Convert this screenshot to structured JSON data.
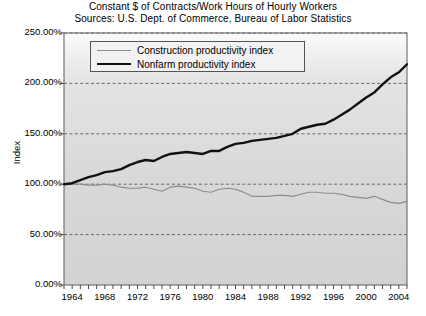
{
  "chart_data": {
    "type": "line",
    "title": "Constant $ of Contracts/Work Hours of Hourly Workers",
    "subtitle": "Sources: U.S. Dept. of Commerce, Bureau of Labor Statistics",
    "xlabel": "",
    "ylabel": "Index",
    "ylim": [
      0,
      250
    ],
    "xlim": [
      1963,
      2005
    ],
    "grid": true,
    "legend_position": "top-center-inside",
    "ytick_labels": [
      "0.00%",
      "50.00%",
      "100.00%",
      "150.00%",
      "200.00%",
      "250.00%"
    ],
    "ytick_values": [
      0,
      50,
      100,
      150,
      200,
      250
    ],
    "xtick_labels": [
      "1964",
      "1968",
      "1972",
      "1976",
      "1980",
      "1984",
      "1988",
      "1992",
      "1996",
      "2000",
      "2004"
    ],
    "xtick_values": [
      1964,
      1968,
      1972,
      1976,
      1980,
      1984,
      1988,
      1992,
      1996,
      2000,
      2004
    ],
    "x": [
      1963,
      1964,
      1965,
      1966,
      1967,
      1968,
      1969,
      1970,
      1971,
      1972,
      1973,
      1974,
      1975,
      1976,
      1977,
      1978,
      1979,
      1980,
      1981,
      1982,
      1983,
      1984,
      1985,
      1986,
      1987,
      1988,
      1989,
      1990,
      1991,
      1992,
      1993,
      1994,
      1995,
      1996,
      1997,
      1998,
      1999,
      2000,
      2001,
      2002,
      2003,
      2004,
      2005
    ],
    "series": [
      {
        "name": "Construction productivity index",
        "color": "#8c8c8c",
        "width": 1.2,
        "values": [
          100,
          100,
          100,
          99,
          99,
          100,
          99,
          97,
          96,
          96,
          97,
          95,
          93,
          97,
          98,
          97,
          96,
          93,
          92,
          95,
          96,
          95,
          92,
          88,
          88,
          88,
          89,
          89,
          88,
          90,
          92,
          92,
          91,
          91,
          90,
          88,
          87,
          86,
          88,
          85,
          82,
          81,
          83
        ]
      },
      {
        "name": "Nonfarm productivity index",
        "color": "#111111",
        "width": 2.4,
        "values": [
          100,
          101,
          104,
          107,
          109,
          112,
          113,
          115,
          119,
          122,
          124,
          123,
          127,
          130,
          131,
          132,
          131,
          130,
          133,
          133,
          137,
          140,
          141,
          143,
          144,
          145,
          146,
          148,
          150,
          155,
          157,
          159,
          160,
          164,
          169,
          174,
          180,
          186,
          191,
          199,
          206,
          211,
          219
        ]
      }
    ]
  },
  "axes": {
    "y_title": "Index"
  }
}
